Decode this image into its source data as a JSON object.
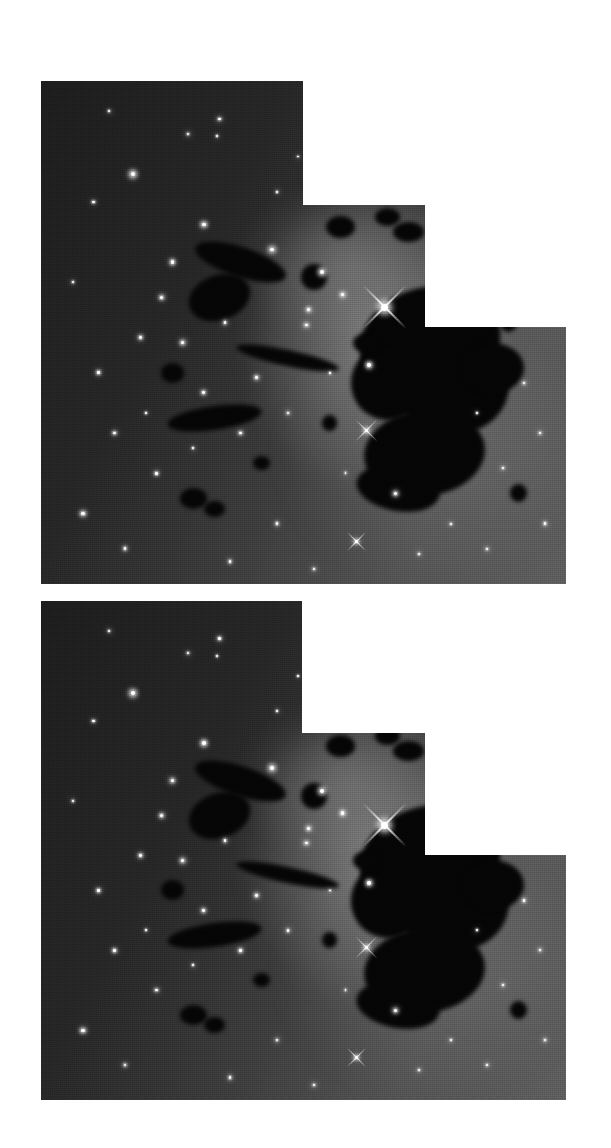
{
  "figure": {
    "background_color": "#ffffff",
    "width": 611,
    "height": 1148,
    "plate_count": 2,
    "panels_per_plate": 3,
    "orientation": "portrait"
  },
  "palette": {
    "page_background": "#ffffff",
    "sky_dark": "#1b1b1b",
    "sky_mid": "#3a3a3a",
    "sky_bright": "#5a5a5a",
    "nebula_glow": "#8e8e8e",
    "dark_cloud": "#050505",
    "star_core": "#ffffff"
  },
  "plates": [
    {
      "id": "plate-top",
      "label": "Top mosaic",
      "x": 41,
      "y": 81,
      "width": 525,
      "height": 503,
      "panels": [
        {
          "id": "panel-top-left",
          "label": "Panel A (upper left field)",
          "x": 0,
          "y": 0,
          "width": 262,
          "height": 503
        },
        {
          "id": "panel-top-middle",
          "label": "Panel B (central nebula)",
          "x": 262,
          "y": 124,
          "width": 122,
          "height": 379
        },
        {
          "id": "panel-top-right",
          "label": "Panel C (dark globule)",
          "x": 384,
          "y": 246,
          "width": 141,
          "height": 257
        }
      ]
    },
    {
      "id": "plate-bottom",
      "label": "Bottom mosaic",
      "x": 41,
      "y": 601,
      "width": 525,
      "height": 499,
      "panels": [
        {
          "id": "panel-bottom-left",
          "label": "Panel A (upper left field)",
          "x": 0,
          "y": 0,
          "width": 261,
          "height": 499
        },
        {
          "id": "panel-bottom-middle",
          "label": "Panel B (central nebula)",
          "x": 261,
          "y": 132,
          "width": 123,
          "height": 367
        },
        {
          "id": "panel-bottom-right",
          "label": "Panel C (dark globule)",
          "x": 384,
          "y": 254,
          "width": 182,
          "height": 245
        }
      ]
    }
  ],
  "chart_data": {
    "type": "heatmap",
    "xlabel": "",
    "ylabel": "",
    "colormap": "grayscale",
    "value_range": [
      0,
      255
    ],
    "grid": false,
    "legend": "none"
  },
  "sky_gradient": {
    "description": "Diffuse nebular brightness gradient across each mosaic",
    "stops": [
      {
        "position": "0%",
        "color": "#1d1d1d",
        "label": "faint outer field"
      },
      {
        "position": "32%",
        "color": "#262626",
        "label": "field"
      },
      {
        "position": "58%",
        "color": "#3e3e3e",
        "label": "nebular rim"
      },
      {
        "position": "78%",
        "color": "#535353",
        "label": "bright nebulosity"
      },
      {
        "position": "100%",
        "color": "#5e5e5e",
        "label": "peak nebulosity"
      }
    ]
  },
  "nebulosity": [
    {
      "name": "central-bright-glow",
      "cx": 64,
      "cy": 52,
      "rx": 26,
      "ry": 30,
      "color": "rgba(170,170,170,0.60)"
    },
    {
      "name": "upper-glow",
      "cx": 58,
      "cy": 36,
      "rx": 20,
      "ry": 16,
      "color": "rgba(140,140,140,0.45)"
    },
    {
      "name": "lower-extended-glow",
      "cx": 75,
      "cy": 74,
      "rx": 30,
      "ry": 26,
      "color": "rgba(125,125,125,0.40)"
    },
    {
      "name": "right-halo",
      "cx": 88,
      "cy": 58,
      "rx": 22,
      "ry": 30,
      "color": "rgba(110,110,110,0.35)"
    }
  ],
  "dark_clouds": [
    {
      "name": "main-globule-upper",
      "cx": 74,
      "cy": 52,
      "rx": 13.5,
      "ry": 11.0,
      "rot": -14
    },
    {
      "name": "main-globule-core",
      "cx": 78,
      "cy": 60,
      "rx": 11.0,
      "ry": 10.0,
      "rot": 8
    },
    {
      "name": "main-globule-lower",
      "cx": 73,
      "cy": 74,
      "rx": 11.5,
      "ry": 8.5,
      "rot": -6
    },
    {
      "name": "globule-tail",
      "cx": 66,
      "cy": 60,
      "rx": 7.0,
      "ry": 7.5,
      "rot": 20
    },
    {
      "name": "globule-spur-east",
      "cx": 86,
      "cy": 57,
      "rx": 6.0,
      "ry": 5.0,
      "rot": 0
    },
    {
      "name": "globule-foot",
      "cx": 68,
      "cy": 81,
      "rx": 8.0,
      "ry": 4.5,
      "rot": 10
    },
    {
      "name": "filament-nw",
      "cx": 38,
      "cy": 36,
      "rx": 9.0,
      "ry": 3.0,
      "rot": 18
    },
    {
      "name": "filament-nw-2",
      "cx": 34,
      "cy": 43,
      "rx": 6.0,
      "ry": 4.5,
      "rot": -20
    },
    {
      "name": "filament-mid",
      "cx": 47,
      "cy": 55,
      "rx": 10.0,
      "ry": 1.6,
      "rot": 12
    },
    {
      "name": "filament-sw",
      "cx": 33,
      "cy": 67,
      "rx": 9.0,
      "ry": 2.4,
      "rot": -8
    },
    {
      "name": "blob-west",
      "cx": 25,
      "cy": 58,
      "rx": 2.2,
      "ry": 2.0,
      "rot": 0
    },
    {
      "name": "blob-south",
      "cx": 29,
      "cy": 83,
      "rx": 2.6,
      "ry": 2.0,
      "rot": 0
    },
    {
      "name": "blob-south-2",
      "cx": 33,
      "cy": 85,
      "rx": 2.0,
      "ry": 1.6,
      "rot": 0
    },
    {
      "name": "blob-centre",
      "cx": 42,
      "cy": 76,
      "rx": 1.6,
      "ry": 1.4,
      "rot": 0
    },
    {
      "name": "blob-ne-a",
      "cx": 57,
      "cy": 29,
      "rx": 2.8,
      "ry": 2.2,
      "rot": 0
    },
    {
      "name": "blob-ne-b",
      "cx": 66,
      "cy": 27,
      "rx": 2.4,
      "ry": 1.8,
      "rot": 0
    },
    {
      "name": "blob-ne-c",
      "cx": 70,
      "cy": 30,
      "rx": 3.0,
      "ry": 2.0,
      "rot": 0
    },
    {
      "name": "blob-nebula-edge",
      "cx": 52,
      "cy": 39,
      "rx": 2.4,
      "ry": 2.6,
      "rot": 0
    },
    {
      "name": "blob-globule-nw",
      "cx": 62,
      "cy": 52,
      "rx": 2.6,
      "ry": 2.0,
      "rot": 0
    },
    {
      "name": "blob-east",
      "cx": 89,
      "cy": 48,
      "rx": 1.6,
      "ry": 2.0,
      "rot": 0
    },
    {
      "name": "blob-east-low",
      "cx": 91,
      "cy": 82,
      "rx": 1.6,
      "ry": 1.8,
      "rot": 0
    },
    {
      "name": "blob-mid-low",
      "cx": 55,
      "cy": 68,
      "rx": 1.4,
      "ry": 1.6,
      "rot": 0
    }
  ],
  "stars": [
    {
      "name": "bright-star-diffraction",
      "x": 65.5,
      "y": 45.0,
      "r": 3.4,
      "spikes": true,
      "label": "saturated foreground star"
    },
    {
      "name": "star-ne-bright",
      "x": 86.5,
      "y": 40.5,
      "r": 1.9,
      "spikes": false
    },
    {
      "name": "star-e-bright",
      "x": 94.0,
      "y": 43.5,
      "r": 2.1,
      "spikes": false
    },
    {
      "name": "star-globule-w",
      "x": 62.5,
      "y": 56.5,
      "r": 1.7,
      "spikes": false
    },
    {
      "name": "star-globule-sw",
      "x": 62.0,
      "y": 69.5,
      "r": 1.7,
      "spikes": true
    },
    {
      "name": "star-globule-s",
      "x": 67.5,
      "y": 82.0,
      "r": 1.6,
      "spikes": false
    },
    {
      "name": "star-south-spike",
      "x": 60.0,
      "y": 91.5,
      "r": 1.5,
      "spikes": true
    },
    {
      "name": "star-centre-a",
      "x": 53.5,
      "y": 38.0,
      "r": 2.0,
      "spikes": false
    },
    {
      "name": "star-centre-b",
      "x": 57.5,
      "y": 42.5,
      "r": 1.6,
      "spikes": false
    },
    {
      "name": "star-centre-c",
      "x": 51.0,
      "y": 45.5,
      "r": 1.5,
      "spikes": false
    },
    {
      "name": "star-centre-d",
      "x": 50.5,
      "y": 48.5,
      "r": 1.4,
      "spikes": false
    },
    {
      "name": "star-pair-left",
      "x": 44.0,
      "y": 33.5,
      "r": 1.9,
      "spikes": false
    },
    {
      "name": "star-upper-mid",
      "x": 31.0,
      "y": 28.5,
      "r": 1.8,
      "spikes": false
    },
    {
      "name": "star-upper-left",
      "x": 17.5,
      "y": 18.5,
      "r": 2.1,
      "spikes": false
    },
    {
      "name": "star-ul-small",
      "x": 28.0,
      "y": 10.5,
      "r": 1.1,
      "spikes": false
    },
    {
      "name": "star-ul-small-2",
      "x": 33.5,
      "y": 11.0,
      "r": 0.9,
      "spikes": false
    },
    {
      "name": "star-top-right",
      "x": 34.0,
      "y": 7.5,
      "r": 1.2,
      "spikes": false
    },
    {
      "name": "star-left-a",
      "x": 25.0,
      "y": 36.0,
      "r": 1.6,
      "spikes": false
    },
    {
      "name": "star-left-b",
      "x": 23.0,
      "y": 43.0,
      "r": 1.5,
      "spikes": false
    },
    {
      "name": "star-left-c",
      "x": 19.0,
      "y": 51.0,
      "r": 1.4,
      "spikes": false
    },
    {
      "name": "star-left-d",
      "x": 27.0,
      "y": 52.0,
      "r": 1.6,
      "spikes": false
    },
    {
      "name": "star-left-e",
      "x": 11.0,
      "y": 58.0,
      "r": 1.3,
      "spikes": false
    },
    {
      "name": "star-left-f",
      "x": 31.0,
      "y": 62.0,
      "r": 1.4,
      "spikes": false
    },
    {
      "name": "star-left-g",
      "x": 14.0,
      "y": 70.0,
      "r": 1.3,
      "spikes": false
    },
    {
      "name": "star-left-h",
      "x": 22.0,
      "y": 78.0,
      "r": 1.2,
      "spikes": false
    },
    {
      "name": "star-left-i",
      "x": 8.0,
      "y": 86.0,
      "r": 1.6,
      "spikes": false
    },
    {
      "name": "star-left-j",
      "x": 16.0,
      "y": 93.0,
      "r": 1.3,
      "spikes": false
    },
    {
      "name": "star-bottom-a",
      "x": 36.0,
      "y": 95.5,
      "r": 1.2,
      "spikes": false
    },
    {
      "name": "star-bottom-b",
      "x": 45.0,
      "y": 88.0,
      "r": 1.2,
      "spikes": false
    },
    {
      "name": "star-bottom-c",
      "x": 52.0,
      "y": 97.0,
      "r": 1.1,
      "spikes": false
    },
    {
      "name": "star-mid-a",
      "x": 41.0,
      "y": 59.0,
      "r": 1.4,
      "spikes": false
    },
    {
      "name": "star-mid-b",
      "x": 38.0,
      "y": 70.0,
      "r": 1.3,
      "spikes": false
    },
    {
      "name": "star-mid-c",
      "x": 47.0,
      "y": 66.0,
      "r": 1.2,
      "spikes": false
    },
    {
      "name": "star-mid-d",
      "x": 35.0,
      "y": 48.0,
      "r": 1.2,
      "spikes": false
    },
    {
      "name": "star-ne-a",
      "x": 76.0,
      "y": 31.0,
      "r": 1.3,
      "spikes": false
    },
    {
      "name": "star-ne-b",
      "x": 82.0,
      "y": 35.0,
      "r": 1.1,
      "spikes": false
    },
    {
      "name": "star-east-a",
      "x": 92.0,
      "y": 60.0,
      "r": 1.2,
      "spikes": false
    },
    {
      "name": "star-east-b",
      "x": 95.0,
      "y": 70.0,
      "r": 1.2,
      "spikes": false
    },
    {
      "name": "star-east-c",
      "x": 88.0,
      "y": 77.0,
      "r": 1.1,
      "spikes": false
    },
    {
      "name": "star-east-d",
      "x": 96.0,
      "y": 88.0,
      "r": 1.2,
      "spikes": false
    },
    {
      "name": "star-east-e",
      "x": 85.0,
      "y": 93.0,
      "r": 1.1,
      "spikes": false
    },
    {
      "name": "star-se-a",
      "x": 78.0,
      "y": 88.0,
      "r": 1.0,
      "spikes": false
    },
    {
      "name": "star-se-b",
      "x": 72.0,
      "y": 94.0,
      "r": 1.0,
      "spikes": false
    },
    {
      "name": "star-mid-high",
      "x": 60.0,
      "y": 22.0,
      "r": 1.2,
      "spikes": false
    },
    {
      "name": "star-mid-high-2",
      "x": 68.0,
      "y": 18.0,
      "r": 1.0,
      "spikes": false
    },
    {
      "name": "star-nw-a",
      "x": 10.0,
      "y": 24.0,
      "r": 1.1,
      "spikes": false
    },
    {
      "name": "star-nw-b",
      "x": 6.0,
      "y": 40.0,
      "r": 1.0,
      "spikes": false
    },
    {
      "name": "star-nw-c",
      "x": 13.0,
      "y": 6.0,
      "r": 1.0,
      "spikes": false
    },
    {
      "name": "star-faint-1",
      "x": 45.0,
      "y": 22.0,
      "r": 0.9,
      "spikes": false
    },
    {
      "name": "star-faint-2",
      "x": 49.0,
      "y": 15.0,
      "r": 0.8,
      "spikes": false
    },
    {
      "name": "star-faint-3",
      "x": 20.0,
      "y": 66.0,
      "r": 0.9,
      "spikes": false
    },
    {
      "name": "star-faint-4",
      "x": 29.0,
      "y": 73.0,
      "r": 0.9,
      "spikes": false
    },
    {
      "name": "star-faint-5",
      "x": 55.0,
      "y": 58.0,
      "r": 0.9,
      "spikes": false
    },
    {
      "name": "star-faint-6",
      "x": 58.0,
      "y": 78.0,
      "r": 0.9,
      "spikes": false
    },
    {
      "name": "star-faint-7",
      "x": 83.0,
      "y": 66.0,
      "r": 0.9,
      "spikes": false
    },
    {
      "name": "star-faint-8",
      "x": 90.0,
      "y": 33.0,
      "r": 0.9,
      "spikes": false
    }
  ]
}
